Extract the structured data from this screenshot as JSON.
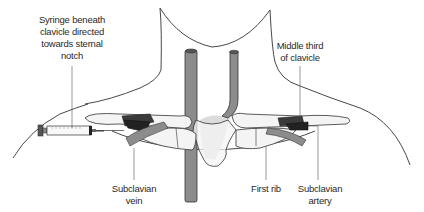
{
  "diagram": {
    "labels": {
      "syringe": {
        "lines": [
          "Syringe beneath",
          "clavicle directed",
          "towards sternal",
          "notch"
        ]
      },
      "middle_third": {
        "lines": [
          "Middle third",
          "of clavicle"
        ]
      },
      "subclavian_vein": {
        "lines": [
          "Subclavian",
          "vein"
        ]
      },
      "first_rib": {
        "lines": [
          "First rib"
        ]
      },
      "subclavian_artery": {
        "lines": [
          "Subclavian",
          "artery"
        ]
      }
    },
    "colors": {
      "outline": "#333333",
      "vessel_grey": "#8c8c8c",
      "vessel_dark": "#3a3a3a",
      "vessel_darker": "#222222",
      "bone_fill": "#f4f4f4",
      "shadow_fill": "#dcdcdc",
      "leader_line": "#555555",
      "text": "#2a2a2a"
    }
  }
}
